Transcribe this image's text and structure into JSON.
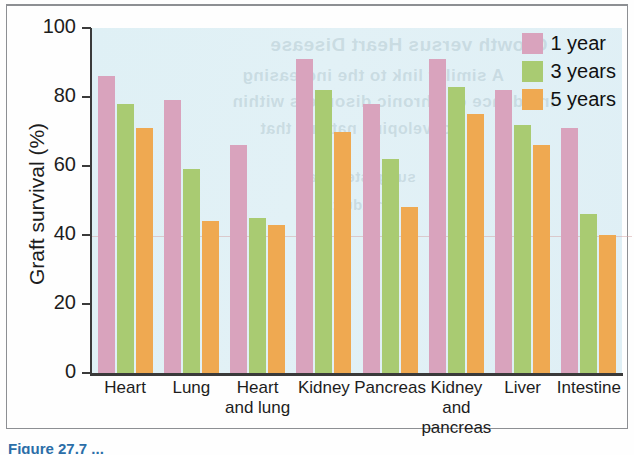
{
  "chart_data": {
    "type": "bar",
    "title": "",
    "xlabel": "",
    "ylabel": "Graft survival (%)",
    "ylim": [
      0,
      100
    ],
    "yticks": [
      0,
      20,
      40,
      60,
      80,
      100
    ],
    "ytick_labels": [
      "0",
      "20",
      "40",
      "60",
      "80",
      "100"
    ],
    "grid": false,
    "legend_position": "top-right",
    "categories": [
      "Heart",
      "Lung",
      "Heart and lung",
      "Kidney",
      "Pancreas",
      "Kidney and pancreas",
      "Liver",
      "Intestine"
    ],
    "category_lines": [
      [
        "Heart"
      ],
      [
        "Lung"
      ],
      [
        "Heart",
        "and lung"
      ],
      [
        "Kidney"
      ],
      [
        "Pancreas"
      ],
      [
        "Kidney",
        "and",
        "pancreas"
      ],
      [
        "Liver"
      ],
      [
        "Intestine"
      ]
    ],
    "series": [
      {
        "name": "1 year",
        "color": "#d9a3bd",
        "values": [
          86,
          79,
          66,
          91,
          78,
          91,
          82,
          71
        ]
      },
      {
        "name": "3 years",
        "color": "#a9cb72",
        "values": [
          78,
          59,
          45,
          82,
          62,
          83,
          72,
          46
        ]
      },
      {
        "name": "5 years",
        "color": "#efa951",
        "values": [
          71,
          44,
          43,
          70,
          48,
          75,
          66,
          40
        ]
      }
    ]
  },
  "legend": {
    "items": [
      {
        "label": "1 year",
        "color": "#d9a3bd"
      },
      {
        "label": "3 years",
        "color": "#a9cb72"
      },
      {
        "label": "5 years",
        "color": "#efa951"
      }
    ]
  },
  "axes": {
    "y_title": "Graft survival (%)",
    "y_tick_0": "0",
    "y_tick_1": "20",
    "y_tick_2": "40",
    "y_tick_3": "60",
    "y_tick_4": "80",
    "y_tick_5": "100"
  },
  "bleed_text": {
    "line1": "Growth versus Heart Disease",
    "line2": "A similar link to the increasing",
    "line3": "incidence of Chronic disorders within",
    "line4": "developing nations that",
    "line5": "suggested that",
    "line6": "in adults"
  },
  "caption": {
    "text": "Figure 27.7  ..."
  },
  "colors": {
    "plot_background": "#ddeef4",
    "axis": "#3a3a3a",
    "text": "#1d1d1d",
    "series_1_year": "#d9a3bd",
    "series_3_years": "#a9cb72",
    "series_5_years": "#efa951"
  }
}
